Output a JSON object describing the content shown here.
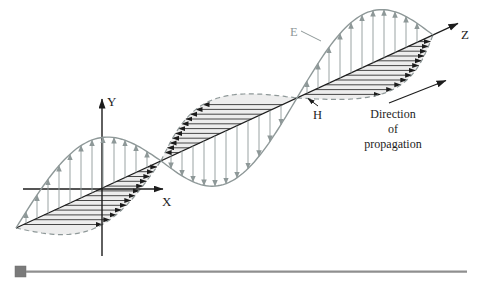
{
  "figure": {
    "axis_labels": {
      "x": "X",
      "y": "Y",
      "z": "Z"
    },
    "field_labels": {
      "e": "E",
      "h": "H"
    },
    "direction_caption": {
      "line1": "Direction",
      "line2": "of",
      "line3": "propagation"
    },
    "colors": {
      "ink": "#1c1c1c",
      "field_gray": "#8e9898",
      "hatch_fill": "#ededed",
      "bar_line": "#8f8f8f",
      "bar_square": "#7a7a7a"
    }
  }
}
